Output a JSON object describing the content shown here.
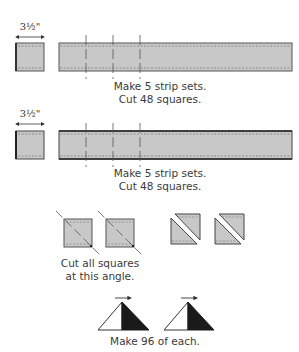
{
  "diagram": {
    "type": "quilt-piecing-instructions",
    "colors": {
      "fabric_fill": "#c8c8c8",
      "outline": "#555555",
      "dark_fabric": "#1a1a1a",
      "light_fabric": "#ffffff",
      "text": "#3a3a3a"
    },
    "rows": [
      {
        "id": "strip-set-1",
        "dimension_label": "3½\"",
        "caption_line1": "Make 5 strip sets.",
        "caption_line2": "Cut 48 squares."
      },
      {
        "id": "strip-set-2",
        "dimension_label": "3½\"",
        "caption_line1": "Make 5 strip sets.",
        "caption_line2": "Cut 48 squares."
      },
      {
        "id": "cut-squares",
        "caption_line1": "Cut all squares",
        "caption_line2": "at this angle."
      },
      {
        "id": "triangles",
        "caption_line1": "Make 96 of each."
      }
    ]
  }
}
